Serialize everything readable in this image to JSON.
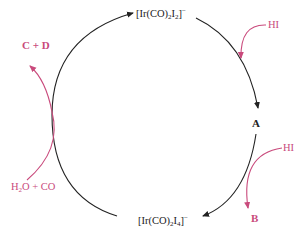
{
  "diagram": {
    "type": "catalytic-cycle",
    "colors": {
      "cycle_arrow": "#222222",
      "side_arrow": "#c94a7c",
      "species_text": "#222222",
      "reagent_text": "#c94a7c"
    },
    "species": {
      "top": {
        "prefix": "[Ir(CO)",
        "sub1": "2",
        "mid": "I",
        "sub2": "2",
        "close": "]",
        "charge": "−"
      },
      "right": {
        "label": "A"
      },
      "bottom": {
        "prefix": "[Ir(CO)",
        "sub1": "2",
        "mid": "I",
        "sub2": "4",
        "close": "]",
        "charge": "−"
      }
    },
    "reagents_in": [
      {
        "label": "HI",
        "position": "upper-right"
      },
      {
        "label": "HI",
        "position": "lower-right"
      },
      {
        "label_pre": "H",
        "label_sub": "2",
        "label_post": "O + CO",
        "position": "lower-left"
      }
    ],
    "products_out": [
      {
        "label": "B",
        "position": "lower-right"
      },
      {
        "label": "C + D",
        "position": "upper-left"
      }
    ]
  }
}
